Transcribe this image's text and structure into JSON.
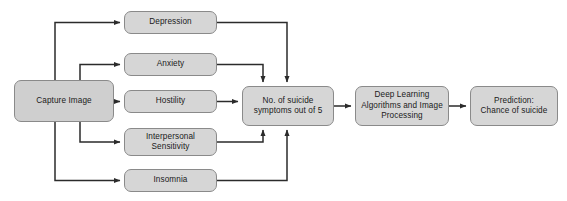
{
  "diagram": {
    "colors": {
      "node_fill": "#d6d6d6",
      "node_fill_source": "#cfcfcf",
      "node_border": "#8a8a8a",
      "connector": "#2b2b2b",
      "background": "#ffffff",
      "text": "#1a1a1a"
    },
    "nodes": {
      "capture_image": {
        "label": "Capture Image",
        "x": 14,
        "y": 80,
        "w": 100,
        "h": 42
      },
      "depression": {
        "label": "Depression",
        "x": 124,
        "y": 11,
        "w": 93,
        "h": 23
      },
      "anxiety": {
        "label": "Anxiety",
        "x": 124,
        "y": 53,
        "w": 93,
        "h": 23
      },
      "hostility": {
        "label": "Hostility",
        "x": 124,
        "y": 90,
        "w": 93,
        "h": 23
      },
      "interpersonal_sensitivity": {
        "label": "Interpersonal\nSensitivity",
        "x": 124,
        "y": 128,
        "w": 93,
        "h": 28
      },
      "insomnia": {
        "label": "Insomnia",
        "x": 124,
        "y": 169,
        "w": 93,
        "h": 23
      },
      "suicide_symptoms": {
        "label": "No. of suicide\nsymptoms out of 5",
        "x": 242,
        "y": 86,
        "w": 92,
        "h": 40
      },
      "deep_learning": {
        "label": "Deep Learning\nAlgorithms and Image\nProcessing",
        "x": 355,
        "y": 86,
        "w": 94,
        "h": 40
      },
      "prediction": {
        "label": "Prediction:\nChance of suicide",
        "x": 470,
        "y": 86,
        "w": 88,
        "h": 40
      }
    },
    "edges": [
      {
        "name": "capture-to-depression",
        "from": "capture_image",
        "to": "depression"
      },
      {
        "name": "capture-to-anxiety",
        "from": "capture_image",
        "to": "anxiety"
      },
      {
        "name": "capture-to-hostility",
        "from": "capture_image",
        "to": "hostility"
      },
      {
        "name": "capture-to-interpersonal-sensitivity",
        "from": "capture_image",
        "to": "interpersonal_sensitivity"
      },
      {
        "name": "capture-to-insomnia",
        "from": "capture_image",
        "to": "insomnia"
      },
      {
        "name": "depression-to-suicide-symptoms",
        "from": "depression",
        "to": "suicide_symptoms"
      },
      {
        "name": "anxiety-to-suicide-symptoms",
        "from": "anxiety",
        "to": "suicide_symptoms"
      },
      {
        "name": "hostility-to-suicide-symptoms",
        "from": "hostility",
        "to": "suicide_symptoms"
      },
      {
        "name": "interpersonal-sensitivity-to-suicide-symptoms",
        "from": "interpersonal_sensitivity",
        "to": "suicide_symptoms"
      },
      {
        "name": "insomnia-to-suicide-symptoms",
        "from": "insomnia",
        "to": "suicide_symptoms"
      },
      {
        "name": "suicide-symptoms-to-deep-learning",
        "from": "suicide_symptoms",
        "to": "deep_learning"
      },
      {
        "name": "deep-learning-to-prediction",
        "from": "deep_learning",
        "to": "prediction"
      }
    ]
  }
}
